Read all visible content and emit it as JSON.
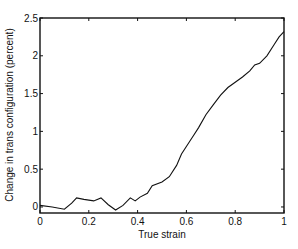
{
  "chart_data": {
    "type": "line",
    "title": "",
    "xlabel": "True strain",
    "ylabel": "Change in trans configuration (percent)",
    "xlim": [
      0,
      1
    ],
    "ylim": [
      -0.08,
      2.5
    ],
    "grid": false,
    "legend": null,
    "xticks": [
      "0",
      "0.2",
      "0.4",
      "0.6",
      "0.8",
      "1"
    ],
    "yticks": [
      "0",
      "0.5",
      "1",
      "1.5",
      "2",
      "2.5"
    ],
    "series": [
      {
        "name": "trans configuration change",
        "color": "#111111",
        "x": [
          0.0,
          0.05,
          0.1,
          0.13,
          0.15,
          0.18,
          0.22,
          0.25,
          0.28,
          0.31,
          0.34,
          0.37,
          0.39,
          0.41,
          0.44,
          0.46,
          0.5,
          0.53,
          0.56,
          0.58,
          0.61,
          0.63,
          0.65,
          0.68,
          0.71,
          0.74,
          0.77,
          0.8,
          0.83,
          0.86,
          0.88,
          0.9,
          0.93,
          0.96,
          0.98,
          1.0
        ],
        "y": [
          0.02,
          0.0,
          -0.03,
          0.05,
          0.12,
          0.1,
          0.08,
          0.12,
          0.03,
          -0.04,
          0.02,
          0.12,
          0.08,
          0.13,
          0.18,
          0.28,
          0.33,
          0.4,
          0.55,
          0.7,
          0.85,
          0.95,
          1.05,
          1.22,
          1.35,
          1.48,
          1.58,
          1.65,
          1.72,
          1.8,
          1.88,
          1.9,
          2.0,
          2.15,
          2.25,
          2.32
        ]
      }
    ]
  }
}
